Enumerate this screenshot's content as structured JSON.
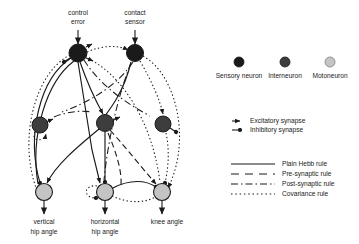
{
  "figure": {
    "background_color": "#ffffff"
  },
  "colors": {
    "sensory_neuron": "#1a1a1a",
    "interneuron": "#3d3d3d",
    "motoneuron": "#c4c4c4",
    "neuron_outline": "#1a1a1a",
    "edge": "#1a1a1a"
  },
  "inputs": [
    {
      "id": "control-error",
      "label_line1": "control",
      "label_line2": "error",
      "x": 78,
      "y": 53
    },
    {
      "id": "contact-sensor",
      "label_line1": "contact",
      "label_line2": "sensor",
      "x": 135,
      "y": 53
    }
  ],
  "outputs": [
    {
      "id": "vertical-hip-angle",
      "label_line1": "vertical",
      "label_line2": "hip angle",
      "x": 44,
      "y": 192
    },
    {
      "id": "horizontal-hip-angle",
      "label_line1": "horizontal",
      "label_line2": "hip angle",
      "x": 105,
      "y": 192
    },
    {
      "id": "knee-angle",
      "label_line1": "knee angle",
      "label_line2": "",
      "x": 162,
      "y": 192
    }
  ],
  "interneurons": [
    {
      "id": "interneuron-left",
      "x": 40,
      "y": 125
    },
    {
      "id": "interneuron-middle",
      "x": 105,
      "y": 123
    },
    {
      "id": "interneuron-right",
      "x": 163,
      "y": 124
    }
  ],
  "legend": {
    "neuron_types": [
      {
        "id": "sensory-neuron",
        "label": "Sensory neuron",
        "color": "#1a1a1a"
      },
      {
        "id": "interneuron",
        "label": "Interneuron",
        "color": "#3d3d3d"
      },
      {
        "id": "motoneuron",
        "label": "Motoneuron",
        "color": "#c4c4c4"
      }
    ],
    "synapse_types": [
      {
        "id": "excitatory-synapse",
        "label": "Excitatory synapse",
        "terminal": "arrow"
      },
      {
        "id": "inhibitory-synapse",
        "label": "Inhibitory synapse",
        "terminal": "filled-circle"
      }
    ],
    "learning_rules": [
      {
        "id": "plain-hebb-rule",
        "label": "Plain Hebb rule",
        "dash": "none"
      },
      {
        "id": "pre-synaptic-rule",
        "label": "Pre-synaptic rule",
        "dash": "7,4"
      },
      {
        "id": "post-synaptic-rule",
        "label": "Post-synaptic rule",
        "dash": "7,3,1.5,3"
      },
      {
        "id": "covariance-rule",
        "label": "Covariance rule",
        "dash": "1.5,2.5"
      }
    ]
  }
}
